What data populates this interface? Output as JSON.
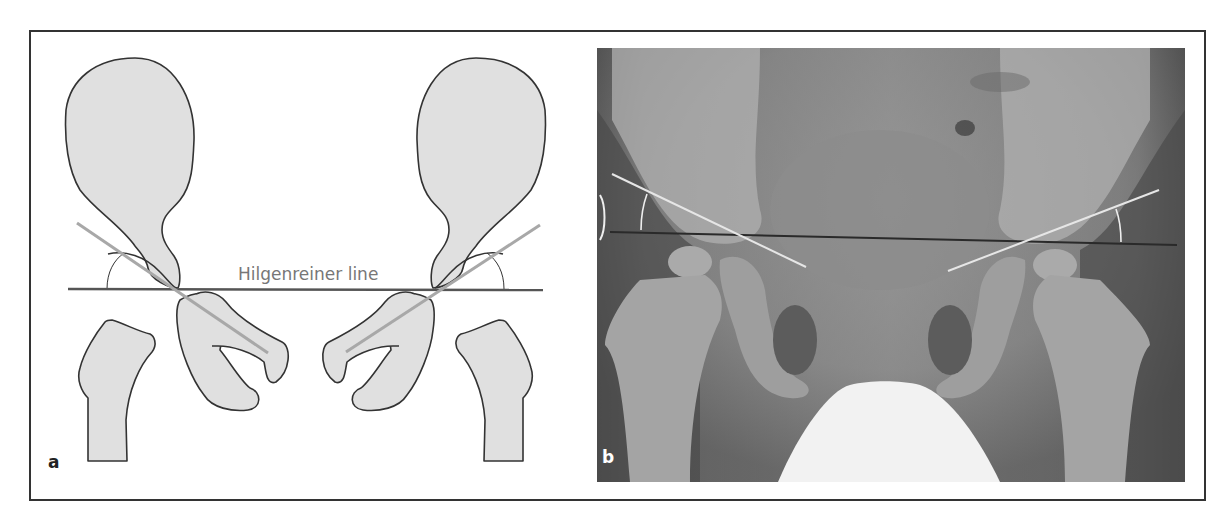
{
  "figure": {
    "panels": [
      {
        "id": "a",
        "letter": "a",
        "type": "schematic drawing"
      },
      {
        "id": "b",
        "letter": "b",
        "type": "pelvic radiograph"
      }
    ],
    "panel_a": {
      "annotation": "Hilgenreiner line",
      "colors": {
        "bone_fill": "#e0e0e0",
        "outline": "#333333",
        "hilgenreiner_line": "#555555",
        "acetabular_line": "#a8a8a8",
        "label": "#777777"
      }
    },
    "panel_b": {
      "colors": {
        "overlay_lines": "#e6e6e6",
        "hilgenreiner_line": "#2a2a2a",
        "shield": "#f2f2f2"
      }
    }
  }
}
